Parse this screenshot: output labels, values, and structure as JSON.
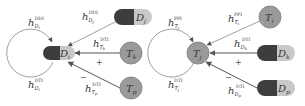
{
  "colors": {
    "drug_dark": "#3d3d3d",
    "drug_light": "#c8c8c8",
    "target": "#9a9a9a",
    "target_stroke": "#8a8a8a",
    "edge": "#888888",
    "text": "#333333"
  },
  "left_panel": {
    "center_node": {
      "type": "drug",
      "label": "D",
      "sub": "i"
    },
    "self_loop_top": {
      "base": "h",
      "sub": "D",
      "subsub": "i",
      "sup": "DDI"
    },
    "self_loop_bottom": {
      "base": "h",
      "sub": "D",
      "subsub": "i",
      "sup": "DTI"
    },
    "neighbors": [
      {
        "type": "drug",
        "label": "D",
        "sub": "j",
        "edge": {
          "base": "h",
          "sub": "D",
          "subsub": "j",
          "sup": "DDI"
        }
      },
      {
        "type": "target",
        "label": "T",
        "sub": "k",
        "edge": {
          "base": "h",
          "sub": "T",
          "subsub": "k",
          "sup": "DTI"
        },
        "sign": "+"
      },
      {
        "type": "target",
        "label": "T",
        "sub": "p",
        "edge": {
          "base": "h",
          "sub": "T",
          "subsub": "p",
          "sup": "DTI"
        },
        "sign": "−"
      }
    ]
  },
  "right_panel": {
    "center_node": {
      "type": "target",
      "label": "T",
      "sub": "j"
    },
    "self_loop_top": {
      "base": "h",
      "sub": "T",
      "subsub": "j",
      "sup": "PPI"
    },
    "self_loop_bottom": {
      "base": "h",
      "sub": "T",
      "subsub": "j",
      "sup": "DTI"
    },
    "neighbors": [
      {
        "type": "target",
        "label": "T",
        "sub": "i",
        "edge": {
          "base": "h",
          "sub": "T",
          "subsub": "i",
          "sup": "PPI"
        }
      },
      {
        "type": "drug",
        "label": "D",
        "sub": "k",
        "edge": {
          "base": "h",
          "sub": "D",
          "subsub": "k",
          "sup": "DTI"
        },
        "sign": "+"
      },
      {
        "type": "drug",
        "label": "D",
        "sub": "p",
        "edge": {
          "base": "h",
          "sub": "D",
          "subsub": "p",
          "sup": "DTI"
        },
        "sign": "−"
      }
    ]
  }
}
